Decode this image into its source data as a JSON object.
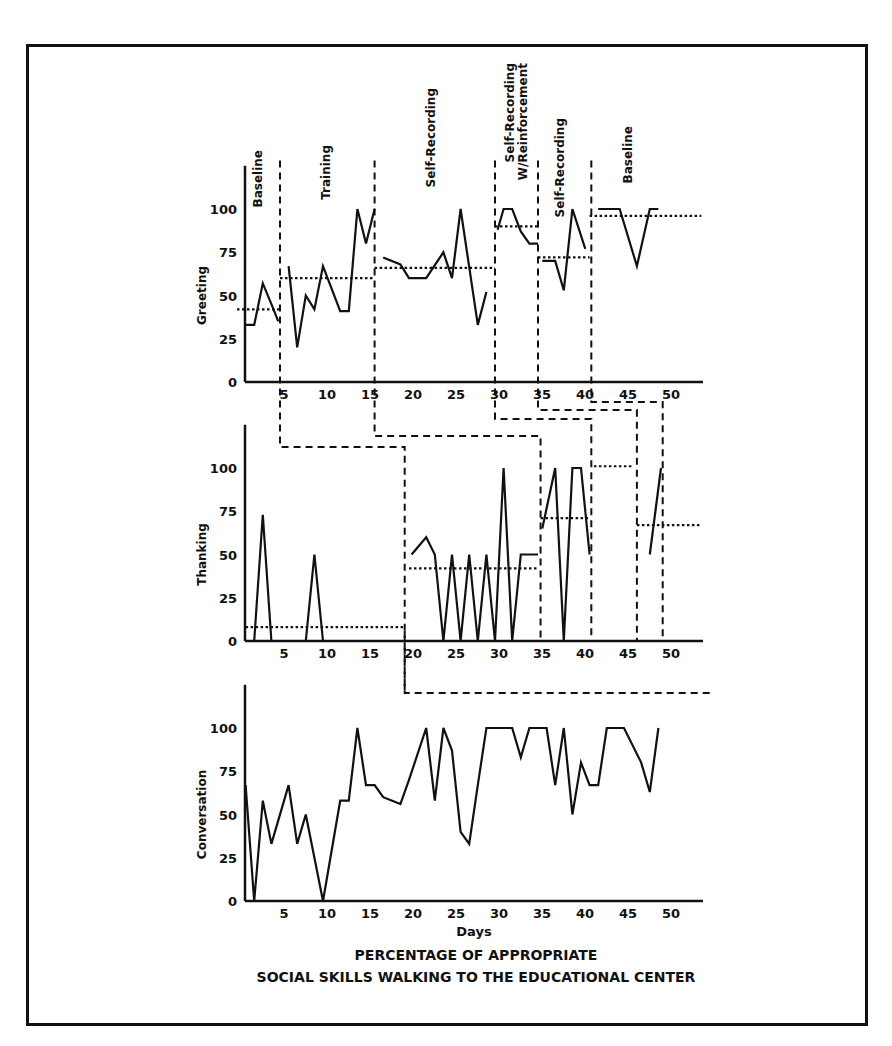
{
  "chart_data": {
    "type": "line",
    "title": "PERCENTAGE OF APPROPRIATE",
    "subtitle": "SOCIAL SKILLS WALKING TO THE EDUCATIONAL CENTER",
    "xlabel": "Days",
    "xlim": [
      0,
      55
    ],
    "x_ticks": [
      5,
      10,
      15,
      20,
      25,
      30,
      35,
      40,
      45,
      50
    ],
    "y_ticks": [
      0,
      25,
      50,
      75,
      100
    ],
    "ylim": [
      0,
      120
    ],
    "grid": false,
    "panels": [
      {
        "name": "greeting",
        "ylabel": "Greeting",
        "phases": [
          {
            "label": "Baseline",
            "start": 0,
            "end": 5
          },
          {
            "label": "Training",
            "start": 5,
            "end": 16
          },
          {
            "label": "Self-Recording",
            "start": 16,
            "end": 30
          },
          {
            "label": "Self-Recording W/Reinforcement",
            "label_lines": [
              "Self-Recording",
              "W/Reinforcement"
            ],
            "start": 30,
            "end": 35
          },
          {
            "label": "Self-Recording",
            "start": 35,
            "end": 41
          },
          {
            "label": "Baseline",
            "start": 41,
            "end": 55
          }
        ],
        "phase_means": [
          {
            "start": 0,
            "end": 5,
            "value": 42
          },
          {
            "start": 5,
            "end": 16,
            "value": 60
          },
          {
            "start": 16,
            "end": 30,
            "value": 66
          },
          {
            "start": 30,
            "end": 35,
            "value": 90
          },
          {
            "start": 35,
            "end": 41,
            "value": 72
          },
          {
            "start": 41,
            "end": 54,
            "value": 96
          }
        ],
        "segments": [
          {
            "x": [
              1,
              2,
              3,
              4,
              4.8
            ],
            "y": [
              33,
              33,
              57,
              45,
              35
            ]
          },
          {
            "x": [
              6,
              7,
              8,
              9,
              10,
              12,
              13,
              14,
              15,
              16
            ],
            "y": [
              67,
              20,
              50,
              42,
              67,
              41,
              41,
              100,
              80,
              100
            ]
          },
          {
            "x": [
              17,
              19,
              20,
              22,
              24,
              25,
              26,
              28,
              29
            ],
            "y": [
              72,
              68,
              60,
              60,
              75,
              60,
              100,
              33,
              52
            ]
          },
          {
            "x": [
              30.3,
              31,
              32,
              33,
              34,
              35
            ],
            "y": [
              88,
              100,
              100,
              87,
              80,
              80
            ]
          },
          {
            "x": [
              35.5,
              37,
              38,
              39,
              40.5
            ],
            "y": [
              70,
              70,
              53,
              100,
              77
            ]
          },
          {
            "x": [
              42,
              44.5,
              46.5,
              48,
              49
            ],
            "y": [
              100,
              100,
              67,
              100,
              100
            ]
          }
        ]
      },
      {
        "name": "thanking",
        "ylabel": "Thanking",
        "phase_means": [
          {
            "start": 1,
            "end": 19.5,
            "value": 8
          },
          {
            "start": 20,
            "end": 35,
            "value": 42
          },
          {
            "start": 35.3,
            "end": 41,
            "value": 71
          },
          {
            "start": 41.5,
            "end": 46,
            "value": 101
          },
          {
            "start": 46.5,
            "end": 54,
            "value": 67
          }
        ],
        "segments": [
          {
            "x": [
              2,
              3,
              4,
              8,
              9,
              10
            ],
            "y": [
              0,
              73,
              0,
              0,
              50,
              0
            ]
          },
          {
            "x": [
              20.3,
              22,
              23,
              24,
              25,
              26,
              27,
              28,
              29,
              30,
              31,
              32,
              33,
              35
            ],
            "y": [
              50,
              60,
              50,
              0,
              50,
              0,
              50,
              0,
              50,
              0,
              100,
              0,
              50,
              50
            ]
          },
          {
            "x": [
              35.5,
              37,
              38,
              39,
              40,
              41
            ],
            "y": [
              65,
              100,
              0,
              100,
              100,
              50
            ]
          },
          {
            "x": [
              48,
              49.3
            ],
            "y": [
              50,
              100
            ]
          }
        ]
      },
      {
        "name": "conversation",
        "ylabel": "Conversation",
        "segments": [
          {
            "x": [
              1,
              2,
              3,
              4,
              6,
              7,
              8,
              10,
              12,
              13,
              14,
              15,
              16,
              17,
              19,
              20,
              22,
              23,
              24,
              25,
              26,
              27,
              28,
              29,
              31,
              32,
              33,
              34,
              35,
              36,
              37,
              38,
              39,
              40,
              41,
              42,
              43,
              44,
              45,
              47,
              48,
              49
            ],
            "y": [
              67,
              0,
              58,
              33,
              67,
              33,
              50,
              0,
              58,
              58,
              100,
              67,
              67,
              60,
              56,
              70,
              100,
              58,
              100,
              87,
              40,
              33,
              67,
              100,
              100,
              100,
              83,
              100,
              100,
              100,
              67,
              100,
              50,
              80,
              67,
              67,
              100,
              100,
              100,
              80,
              63,
              100,
              67
            ]
          }
        ]
      }
    ],
    "phase_change_lines": "dashed staggered lines connecting phase changes across panels (multiple-baseline design)"
  }
}
